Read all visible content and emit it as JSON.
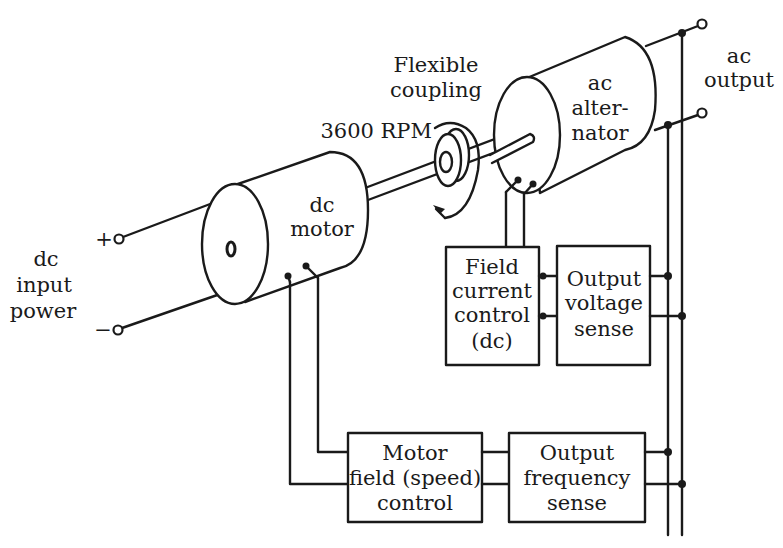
{
  "diagram": {
    "type": "motor-generator system block diagram",
    "colors": {
      "line": "#1a1a1a",
      "background": "#ffffff"
    },
    "labels": {
      "dc_input": [
        "dc",
        "input",
        "power"
      ],
      "plus": "+",
      "minus": "−",
      "dc_motor": [
        "dc",
        "motor"
      ],
      "coupling": [
        "Flexible",
        "coupling"
      ],
      "rpm": "3600 RPM",
      "alternator": [
        "ac",
        "alter-",
        "nator"
      ],
      "ac_output": [
        "ac",
        "output"
      ]
    },
    "blocks": {
      "field_current_control": [
        "Field",
        "current",
        "control",
        "(dc)"
      ],
      "output_voltage_sense": [
        "Output",
        "voltage",
        "sense"
      ],
      "motor_field_control": [
        "Motor",
        "field (speed)",
        "control"
      ],
      "output_frequency_sense": [
        "Output",
        "frequency",
        "sense"
      ]
    }
  }
}
